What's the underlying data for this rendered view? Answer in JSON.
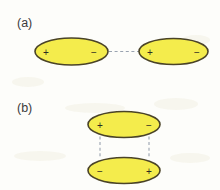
{
  "figure": {
    "background_color": "#fdfdfa",
    "dipole_fill_color": "#f4ec4c",
    "dipole_stroke_color": "#4a4327",
    "dashed_line_color": "#9aa3b0",
    "label_color": "#3b3b3b",
    "charge_color": "#2c2c22",
    "panels": [
      {
        "id": "panel-a",
        "label": "(a)",
        "label_x": 17,
        "label_y": 27,
        "arrangement": "head-to-tail",
        "dipoles": [
          {
            "id": "dipole-a-left",
            "cx": 71.5,
            "cy": 51.5,
            "rx": 36.5,
            "ry": 13.5,
            "left_charge": "+",
            "right_charge": "−",
            "left_charge_x": 46,
            "right_charge_x": 94,
            "charge_y": 52
          },
          {
            "id": "dipole-a-right",
            "cx": 173.5,
            "cy": 51.5,
            "rx": 34.5,
            "ry": 13,
            "left_charge": "+",
            "right_charge": "−",
            "left_charge_x": 150,
            "right_charge_x": 197,
            "charge_y": 52
          }
        ],
        "connectors": [
          {
            "id": "connector-a-1",
            "x1": 109,
            "y1": 51.5,
            "x2": 139,
            "y2": 51.5
          }
        ]
      },
      {
        "id": "panel-b",
        "label": "(b)",
        "label_x": 17,
        "label_y": 112,
        "arrangement": "antiparallel-stacked",
        "dipoles": [
          {
            "id": "dipole-b-top",
            "cx": 124,
            "cy": 124.5,
            "rx": 36,
            "ry": 13,
            "left_charge": "+",
            "right_charge": "−",
            "left_charge_x": 100,
            "right_charge_x": 149,
            "charge_y": 125
          },
          {
            "id": "dipole-b-bottom",
            "cx": 124,
            "cy": 170.5,
            "rx": 36,
            "ry": 13,
            "left_charge": "−",
            "right_charge": "+",
            "left_charge_x": 100,
            "right_charge_x": 149,
            "charge_y": 171
          }
        ],
        "connectors": [
          {
            "id": "connector-b-1",
            "x1": 100,
            "y1": 136.5,
            "x2": 100,
            "y2": 158.5
          },
          {
            "id": "connector-b-2",
            "x1": 149,
            "y1": 136.5,
            "x2": 149,
            "y2": 158.5
          }
        ]
      }
    ]
  }
}
